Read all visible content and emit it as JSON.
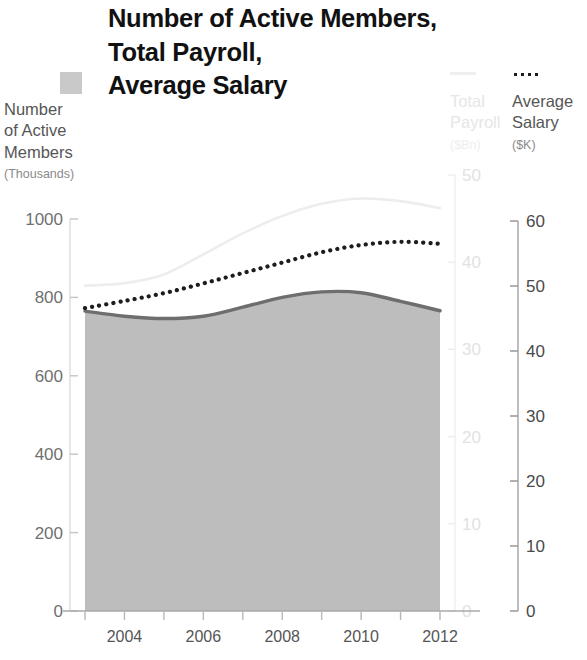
{
  "title": {
    "line1": "Number of Active Members,",
    "line2": "Total Payroll,",
    "line3": "Average Salary"
  },
  "legends": {
    "members": {
      "swatch": "filled-square-swatch",
      "name_line1": "Number",
      "name_line2": "of Active",
      "name_line3": "Members",
      "unit": "(Thousands)",
      "color": "#c9c9c9"
    },
    "payroll": {
      "swatch": "thin-line-swatch",
      "name_line1": "Total",
      "name_line2": "Payroll",
      "unit": "($Bn)",
      "color": "#ededed"
    },
    "salary": {
      "swatch": "dotted-line-swatch",
      "name_line1": "Average",
      "name_line2": "Salary",
      "unit": "($K)",
      "color": "#1d1d1d"
    }
  },
  "axes": {
    "left": {
      "name": "Number of Active Members",
      "unit": "Thousands",
      "ticks": [
        "0",
        "200",
        "400",
        "600",
        "800",
        "1000"
      ],
      "min": 0,
      "max": 1000,
      "color": "#707070"
    },
    "middle": {
      "name": "Total Payroll",
      "unit": "$Bn",
      "ticks": [
        "0",
        "10",
        "20",
        "30",
        "40",
        "50"
      ],
      "min": 0,
      "max": 50,
      "color": "#e2e2e2"
    },
    "right": {
      "name": "Average Salary",
      "unit": "$K",
      "ticks": [
        "0",
        "10",
        "20",
        "30",
        "40",
        "50",
        "60"
      ],
      "min": 0,
      "max": 60,
      "color": "#4a4a4a"
    },
    "x": {
      "ticks": [
        "2004",
        "2006",
        "2008",
        "2010",
        "2012"
      ],
      "min": 2003,
      "max": 2012,
      "color": "#555555"
    }
  },
  "chart_data": {
    "type": "area",
    "title": "Number of Active Members, Total Payroll, Average Salary",
    "xlabel": "",
    "ylabel": "Number of Active Members (Thousands)",
    "x": [
      2003,
      2004,
      2005,
      2006,
      2007,
      2008,
      2009,
      2010,
      2011,
      2012
    ],
    "xtick_labels": [
      "2004",
      "2006",
      "2008",
      "2010",
      "2012"
    ],
    "xlim": [
      2003,
      2012
    ],
    "grid": false,
    "legend_position": "top",
    "series": [
      {
        "name": "Number of Active Members",
        "unit": "Thousands",
        "axis": "left",
        "ylim": [
          0,
          1000
        ],
        "style": "filled-area",
        "color": "#bdbdbd",
        "line_color": "#6e6e6e",
        "values": [
          765,
          752,
          746,
          752,
          775,
          800,
          814,
          812,
          790,
          766
        ]
      },
      {
        "name": "Total Payroll",
        "unit": "$Bn",
        "axis": "middle",
        "ylim": [
          0,
          50
        ],
        "style": "line",
        "color": "#ededed",
        "values": [
          37.3,
          37.6,
          38.6,
          40.9,
          43.3,
          45.3,
          46.7,
          47.3,
          47.0,
          46.2
        ]
      },
      {
        "name": "Average Salary",
        "unit": "$K",
        "axis": "right",
        "ylim": [
          0,
          60
        ],
        "style": "dotted-line",
        "color": "#1d1d1d",
        "values": [
          46.6,
          47.7,
          48.9,
          50.4,
          52.0,
          53.6,
          55.2,
          56.3,
          56.8,
          56.5
        ]
      }
    ]
  }
}
